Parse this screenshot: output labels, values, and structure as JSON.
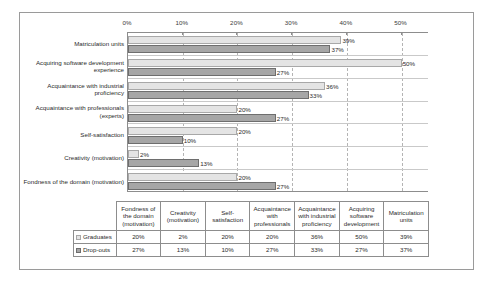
{
  "chart_data": {
    "type": "bar",
    "orientation": "horizontal",
    "title": "",
    "xlabel": "",
    "ylabel": "",
    "xlim": [
      0,
      55
    ],
    "xticks": [
      "0%",
      "10%",
      "20%",
      "30%",
      "40%",
      "50%"
    ],
    "xtick_values": [
      0,
      10,
      20,
      30,
      40,
      50
    ],
    "grid": true,
    "legend_position": "table-left",
    "categories": [
      "Matriculation units",
      "Acquiring software development experience",
      "Acquaintance with industrial proficiency",
      "Acquaintance with professionals (experts)",
      "Self-satisfaction",
      "Creativity (motivation)",
      "Fondness of the domain (motivation)"
    ],
    "series": [
      {
        "name": "Graduates",
        "color": "#e4e4e4",
        "values": [
          39,
          50,
          36,
          20,
          20,
          2,
          20
        ],
        "labels": [
          "39%",
          "50%",
          "36%",
          "20%",
          "20%",
          "2%",
          "20%"
        ]
      },
      {
        "name": "Drop-outs",
        "color": "#a6a6a6",
        "values": [
          37,
          27,
          33,
          27,
          10,
          13,
          27
        ],
        "labels": [
          "37%",
          "27%",
          "33%",
          "27%",
          "10%",
          "13%",
          "27%"
        ]
      }
    ]
  },
  "chart": {
    "category_labels": [
      "Matriculation units",
      "Acquiring software development experience",
      "Acquaintance with industrial proficiency",
      "Acquaintance with professionals (experts)",
      "Self-satisfaction",
      "Creativity (motivation)",
      "Fondness of the domain (motivation)"
    ],
    "axis_ticks": [
      "0%",
      "10%",
      "20%",
      "30%",
      "40%",
      "50%"
    ]
  },
  "table": {
    "headers": [
      "Fondness of the domain (motivation)",
      "Creativity (motivation)",
      "Self-satisfaction",
      "Acquaintance with professionals",
      "Acquaintance with industrial proficiency",
      "Acquiring software development",
      "Matriculation units"
    ],
    "rows": [
      {
        "label": "Graduates",
        "swatch": "graduates",
        "values": [
          "20%",
          "2%",
          "20%",
          "20%",
          "36%",
          "50%",
          "39%"
        ]
      },
      {
        "label": "Drop-outs",
        "swatch": "dropouts",
        "values": [
          "27%",
          "13%",
          "10%",
          "27%",
          "33%",
          "27%",
          "37%"
        ]
      }
    ]
  }
}
